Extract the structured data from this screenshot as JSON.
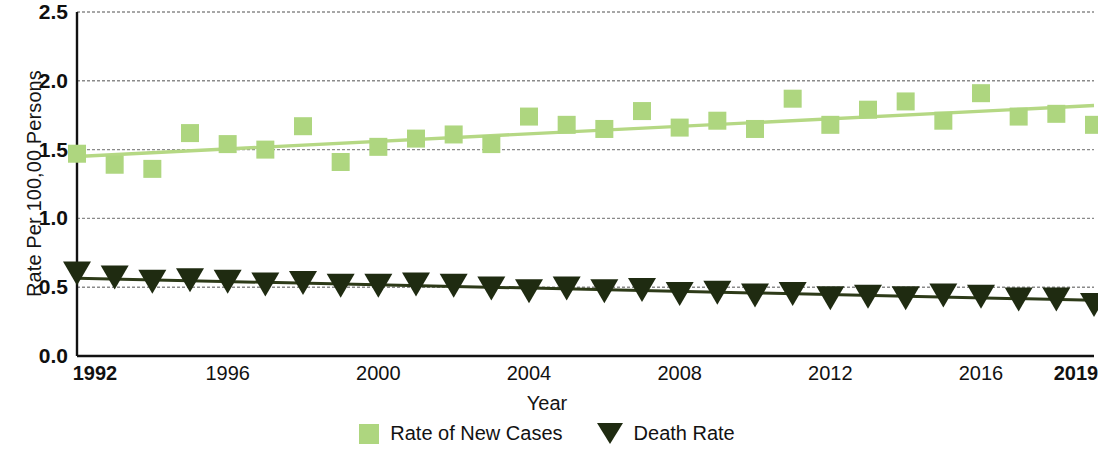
{
  "axes": {
    "y_title": "Rate Per 100,00 Persons",
    "x_title": "Year",
    "y_ticks": [
      "0.0",
      "0.5",
      "1.0",
      "1.5",
      "2.0",
      "2.5"
    ],
    "x_ticks": [
      {
        "label": "1992",
        "bold": true
      },
      {
        "label": "1996",
        "bold": false
      },
      {
        "label": "2000",
        "bold": false
      },
      {
        "label": "2004",
        "bold": false
      },
      {
        "label": "2008",
        "bold": false
      },
      {
        "label": "2012",
        "bold": false
      },
      {
        "label": "2016",
        "bold": false
      },
      {
        "label": "2019",
        "bold": true
      }
    ]
  },
  "legend": {
    "items": [
      {
        "label": "Rate of New Cases",
        "marker": "square-marker",
        "color": "#aed67f"
      },
      {
        "label": "Death Rate",
        "marker": "triangle-down-marker",
        "color": "#1f2b11"
      }
    ]
  },
  "colors": {
    "new_cases": "#aed67f",
    "new_cases_trend": "#b5d884",
    "death_rate": "#1f2b11",
    "death_rate_trend": "#2d3a18",
    "gridline": "#8a8a8a",
    "axis": "#111111"
  },
  "chart_data": {
    "type": "scatter",
    "title": "",
    "subtitle": "",
    "xlabel": "Year",
    "ylabel": "Rate Per 100,00 Persons",
    "xlim": [
      1992,
      2019
    ],
    "ylim": [
      0.0,
      2.5
    ],
    "ytick_values": [
      0.0,
      0.5,
      1.0,
      1.5,
      2.0,
      2.5
    ],
    "xtick_values": [
      1992,
      1996,
      2000,
      2004,
      2008,
      2012,
      2016,
      2019
    ],
    "grid": "horizontal",
    "legend_position": "bottom-center",
    "x": [
      1992,
      1993,
      1994,
      1995,
      1996,
      1997,
      1998,
      1999,
      2000,
      2001,
      2002,
      2003,
      2004,
      2005,
      2006,
      2007,
      2008,
      2009,
      2010,
      2011,
      2012,
      2013,
      2014,
      2015,
      2016,
      2017,
      2018,
      2019
    ],
    "series": [
      {
        "name": "Rate of New Cases",
        "marker": "square",
        "color": "#aed67f",
        "values": [
          1.47,
          1.39,
          1.36,
          1.62,
          1.54,
          1.5,
          1.67,
          1.41,
          1.52,
          1.58,
          1.61,
          1.54,
          1.74,
          1.68,
          1.65,
          1.78,
          1.66,
          1.71,
          1.65,
          1.87,
          1.68,
          1.79,
          1.85,
          1.71,
          1.91,
          1.74,
          1.76,
          1.68
        ],
        "trendline": {
          "start": 1.45,
          "end": 1.82
        }
      },
      {
        "name": "Death Rate",
        "marker": "triangle-down",
        "color": "#1f2b11",
        "values": [
          0.6,
          0.57,
          0.54,
          0.55,
          0.54,
          0.52,
          0.53,
          0.51,
          0.51,
          0.52,
          0.51,
          0.49,
          0.47,
          0.49,
          0.47,
          0.48,
          0.45,
          0.46,
          0.44,
          0.45,
          0.42,
          0.43,
          0.42,
          0.44,
          0.43,
          0.41,
          0.41,
          0.37
        ],
        "trendline": {
          "start": 0.565,
          "end": 0.405
        }
      }
    ]
  }
}
